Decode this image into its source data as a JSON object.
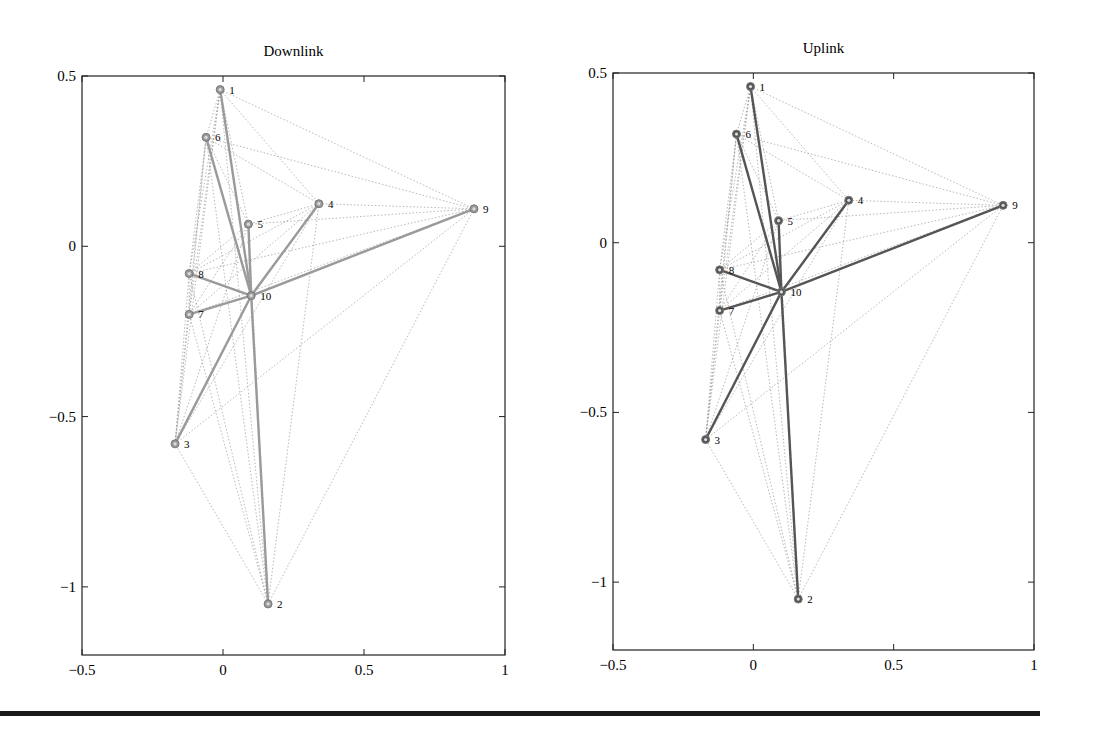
{
  "chart_data": [
    {
      "type": "scatter",
      "subtype": "network-graph",
      "title": "Downlink",
      "xlabel": "",
      "ylabel": "",
      "xlim": [
        -0.5,
        1
      ],
      "ylim": [
        -1.2,
        0.5
      ],
      "xticks": [
        "-0.5",
        "0",
        "0.5",
        "1"
      ],
      "yticks": [
        "0.5",
        "0",
        "-0.5",
        "-1"
      ],
      "grid": false,
      "line_color": "#9a9a9a",
      "nodes": [
        {
          "id": 1,
          "x": -0.01,
          "y": 0.46
        },
        {
          "id": 2,
          "x": 0.16,
          "y": -1.05
        },
        {
          "id": 3,
          "x": -0.17,
          "y": -0.58
        },
        {
          "id": 4,
          "x": 0.34,
          "y": 0.125
        },
        {
          "id": 5,
          "x": 0.09,
          "y": 0.065
        },
        {
          "id": 6,
          "x": -0.06,
          "y": 0.32
        },
        {
          "id": 7,
          "x": -0.12,
          "y": -0.2
        },
        {
          "id": 8,
          "x": -0.12,
          "y": -0.08
        },
        {
          "id": 9,
          "x": 0.89,
          "y": 0.11
        },
        {
          "id": 10,
          "x": 0.1,
          "y": -0.145
        }
      ],
      "bold_edges": [
        [
          10,
          1
        ],
        [
          10,
          2
        ],
        [
          10,
          3
        ],
        [
          10,
          4
        ],
        [
          10,
          5
        ],
        [
          10,
          6
        ],
        [
          10,
          7
        ],
        [
          10,
          8
        ],
        [
          10,
          9
        ]
      ],
      "dotted_edges": "all remaining node pairs"
    },
    {
      "type": "scatter",
      "subtype": "network-graph",
      "title": "Uplink",
      "xlabel": "",
      "ylabel": "",
      "xlim": [
        -0.5,
        1
      ],
      "ylim": [
        -1.2,
        0.5
      ],
      "xticks": [
        "-0.5",
        "0",
        "0.5",
        "1"
      ],
      "yticks": [
        "0.5",
        "0",
        "-0.5",
        "-1"
      ],
      "grid": false,
      "line_color": "#555555",
      "nodes": [
        {
          "id": 1,
          "x": -0.01,
          "y": 0.46
        },
        {
          "id": 2,
          "x": 0.16,
          "y": -1.05
        },
        {
          "id": 3,
          "x": -0.17,
          "y": -0.58
        },
        {
          "id": 4,
          "x": 0.34,
          "y": 0.125
        },
        {
          "id": 5,
          "x": 0.09,
          "y": 0.065
        },
        {
          "id": 6,
          "x": -0.06,
          "y": 0.32
        },
        {
          "id": 7,
          "x": -0.12,
          "y": -0.2
        },
        {
          "id": 8,
          "x": -0.12,
          "y": -0.08
        },
        {
          "id": 9,
          "x": 0.89,
          "y": 0.11
        },
        {
          "id": 10,
          "x": 0.1,
          "y": -0.145
        }
      ],
      "bold_edges": [
        [
          10,
          1
        ],
        [
          10,
          2
        ],
        [
          10,
          3
        ],
        [
          10,
          4
        ],
        [
          10,
          5
        ],
        [
          10,
          6
        ],
        [
          10,
          7
        ],
        [
          10,
          8
        ],
        [
          10,
          9
        ]
      ],
      "dotted_edges": "all remaining node pairs"
    }
  ],
  "panels": [
    {
      "title": "Downlink",
      "box": {
        "x0": 82,
        "x1": 505,
        "y0": 76,
        "y1": 655
      }
    },
    {
      "title": "Uplink",
      "box": {
        "x0": 613,
        "x1": 1034,
        "y0": 73,
        "y1": 650
      }
    }
  ]
}
